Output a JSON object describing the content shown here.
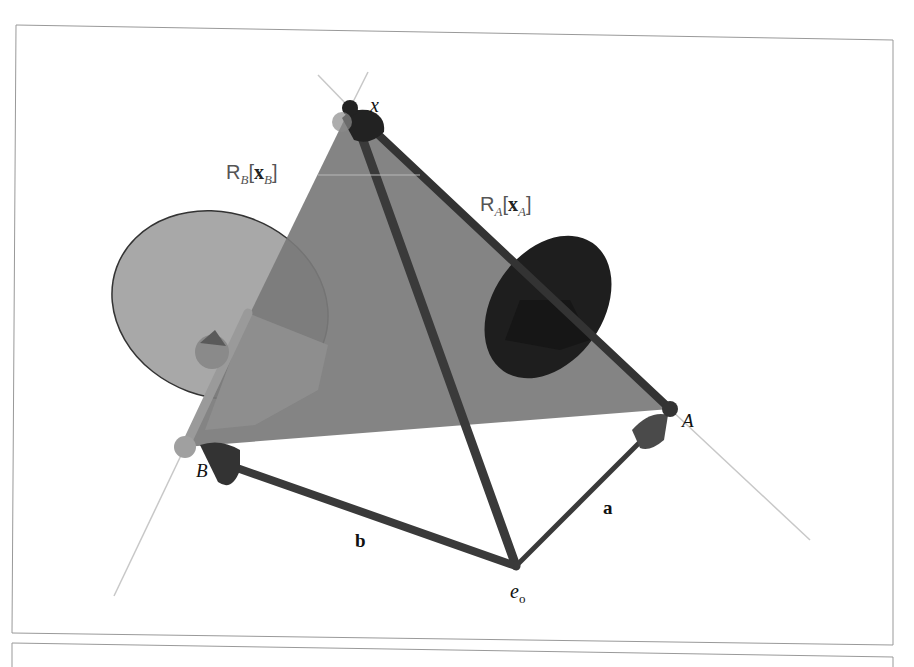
{
  "diagram": {
    "points": {
      "x": {
        "label": "x",
        "pos": [
          350,
          108
        ]
      },
      "A": {
        "label": "A",
        "pos": [
          670,
          409
        ]
      },
      "B": {
        "label": "B",
        "pos": [
          185,
          447
        ]
      },
      "e0": {
        "label": "e",
        "subscript": "o",
        "pos": [
          516,
          566
        ]
      }
    },
    "vectors": {
      "a": {
        "label": "a",
        "from": "e0",
        "to": "A"
      },
      "b": {
        "label": "b",
        "from": "e0",
        "to": "B"
      }
    },
    "planes": {
      "RB": {
        "label_main": "R",
        "label_sub": "B",
        "bracket_open": "[",
        "arg_main": "x",
        "arg_sub": "B",
        "bracket_close": "]"
      },
      "RA": {
        "label_main": "R",
        "label_sub": "A",
        "bracket_open": "[",
        "arg_main": "x",
        "arg_sub": "A",
        "bracket_close": "]"
      }
    },
    "colors": {
      "triangle_fill": "#7a7a7a",
      "edge_dark": "#333333",
      "disc_light": "#a8a8a8",
      "disc_dark": "#1e1e1e",
      "thin_line": "#c8c8c8",
      "frame_stroke": "#999999"
    }
  }
}
